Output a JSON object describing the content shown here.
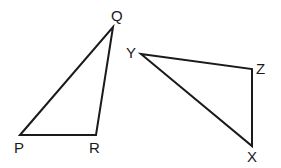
{
  "diagram": {
    "type": "two-triangles",
    "triangles": [
      {
        "name": "PQR",
        "vertices": [
          {
            "label": "P",
            "x": 20,
            "y": 135,
            "label_x": 14,
            "label_y": 153
          },
          {
            "label": "Q",
            "x": 113,
            "y": 27,
            "label_x": 111,
            "label_y": 21
          },
          {
            "label": "R",
            "x": 96,
            "y": 135,
            "label_x": 89,
            "label_y": 153
          }
        ]
      },
      {
        "name": "XYZ",
        "vertices": [
          {
            "label": "Y",
            "x": 141,
            "y": 54,
            "label_x": 126,
            "label_y": 58
          },
          {
            "label": "Z",
            "x": 252,
            "y": 69,
            "label_x": 256,
            "label_y": 74
          },
          {
            "label": "X",
            "x": 252,
            "y": 146,
            "label_x": 247,
            "label_y": 162
          }
        ]
      }
    ],
    "colors": {
      "stroke": "#1a1a1a",
      "background": "#ffffff"
    }
  }
}
